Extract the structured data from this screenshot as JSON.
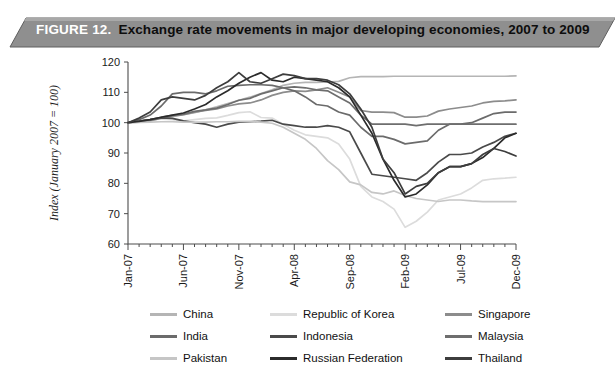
{
  "banner": {
    "figure_label": "FIGURE 12.",
    "title": "Exchange rate movements in major developing economies, 2007 to 2009",
    "banner_color": "#8f8f8f",
    "banner_edge_color": "#5e5e5e",
    "figure_label_color": "#ffffff",
    "title_color": "#0d0d0d"
  },
  "chart_data": {
    "type": "line",
    "title": "Exchange rate movements in major developing economies, 2007 to 2009",
    "xlabel": "",
    "ylabel": "Index (January 2007 = 100)",
    "ylim": [
      60,
      120
    ],
    "ytick_values": [
      60,
      70,
      80,
      90,
      100,
      110,
      120
    ],
    "ytick_labels": [
      "60",
      "70",
      "80",
      "90",
      "100",
      "110",
      "120"
    ],
    "grid": false,
    "legend_position": "bottom",
    "x": [
      "Jan-07",
      "Feb-07",
      "Mar-07",
      "Apr-07",
      "May-07",
      "Jun-07",
      "Jul-07",
      "Aug-07",
      "Sep-07",
      "Oct-07",
      "Nov-07",
      "Dec-07",
      "Jan-08",
      "Feb-08",
      "Mar-08",
      "Apr-08",
      "May-08",
      "Jun-08",
      "Jul-08",
      "Aug-08",
      "Sep-08",
      "Oct-08",
      "Nov-08",
      "Dec-08",
      "Jan-09",
      "Feb-09",
      "Mar-09",
      "Apr-09",
      "May-09",
      "Jun-09",
      "Jul-09",
      "Aug-09",
      "Sep-09",
      "Oct-09",
      "Nov-09",
      "Dec-09"
    ],
    "xtick_labels": [
      "Jan-07",
      "Jun-07",
      "Nov-07",
      "Apr-08",
      "Sep-08",
      "Feb-09",
      "Jul-09",
      "Dec-09"
    ],
    "xtick_indices": [
      0,
      5,
      10,
      15,
      20,
      25,
      30,
      35
    ],
    "series": [
      {
        "name": "China",
        "color": "#b5b5b5",
        "values": [
          100,
          100.4,
          101,
          101.5,
          102,
          102.6,
          103.3,
          104.2,
          105.2,
          106.3,
          107.4,
          108.4,
          109.6,
          110.8,
          112.3,
          113,
          113.3,
          113.3,
          113.4,
          113.6,
          114.8,
          115.2,
          115.2,
          115.2,
          115.3,
          115.3,
          115.3,
          115.3,
          115.3,
          115.3,
          115.3,
          115.3,
          115.3,
          115.3,
          115.3,
          115.4
        ]
      },
      {
        "name": "Republic of Korea",
        "color": "#dcdcdc",
        "values": [
          100,
          100.3,
          100.8,
          101.2,
          101,
          100.6,
          101,
          101.4,
          101.6,
          102.4,
          103.3,
          103.6,
          101.7,
          101.5,
          99.5,
          97.5,
          96,
          95.5,
          95,
          93,
          88,
          79,
          75.5,
          74,
          71.5,
          65.5,
          67.5,
          70.5,
          74.5,
          75.5,
          76.5,
          78.5,
          81,
          81.5,
          81.7,
          82
        ]
      },
      {
        "name": "Singapore",
        "color": "#8c8c8c",
        "values": [
          100,
          100.2,
          100.6,
          101.5,
          102.2,
          102.6,
          103.5,
          104,
          104.5,
          105.5,
          106.2,
          106.5,
          107.5,
          109,
          110,
          110.5,
          110.3,
          110.8,
          111.5,
          110,
          108.5,
          104,
          103.5,
          103.5,
          103.3,
          101.8,
          101.8,
          102.2,
          103.8,
          104.5,
          105,
          105.5,
          106.5,
          107,
          107.2,
          107.5
        ]
      },
      {
        "name": "India",
        "color": "#6b6b6b",
        "values": [
          100,
          101,
          102.5,
          105.5,
          109.5,
          110,
          110,
          109.5,
          110.5,
          112,
          112.3,
          112.5,
          112.5,
          112.3,
          111.5,
          110.5,
          108.5,
          106,
          105.5,
          103.5,
          102.5,
          98.5,
          95.5,
          95.5,
          94.5,
          93,
          93.5,
          94,
          97.5,
          99.5,
          99.5,
          100,
          101.5,
          103,
          103.5,
          103.5
        ]
      },
      {
        "name": "Indonesia",
        "color": "#4a4a4a",
        "values": [
          100,
          100.5,
          101,
          101.6,
          101.4,
          100.6,
          100,
          99.5,
          98.5,
          99.5,
          100.2,
          100.3,
          100.5,
          100.8,
          99.5,
          99,
          98.5,
          98.5,
          99,
          98.5,
          97,
          90,
          83,
          82.5,
          82,
          81.5,
          81,
          83.5,
          87,
          89.5,
          89.5,
          90,
          92,
          93.5,
          95.5,
          96.5
        ]
      },
      {
        "name": "Malaysia",
        "color": "#6e6e6e",
        "values": [
          100,
          100.4,
          101,
          101.8,
          102.4,
          102.8,
          103.7,
          104.2,
          104.8,
          106,
          107.4,
          108,
          109.5,
          110.5,
          111.5,
          111.8,
          111.5,
          110.8,
          110.5,
          108.5,
          106.5,
          102.5,
          99.5,
          99.5,
          99.5,
          99.5,
          99,
          99.5,
          99.5,
          99.5,
          99.5,
          99.5,
          99.5,
          99.5,
          99.5,
          99.5
        ]
      },
      {
        "name": "Pakistan",
        "color": "#c6c6c6",
        "values": [
          100,
          100.1,
          100.2,
          100.3,
          100.3,
          100.2,
          100.2,
          100.2,
          100.3,
          100.3,
          100.4,
          100.4,
          100.2,
          99.8,
          98.5,
          96.5,
          94.5,
          91.5,
          87.5,
          84.5,
          80.5,
          79.5,
          77,
          76.5,
          77.5,
          76,
          75,
          74.5,
          74,
          74.5,
          74.5,
          74.2,
          74,
          74,
          74,
          74
        ]
      },
      {
        "name": "Russian Federation",
        "color": "#2b2b2b",
        "values": [
          100,
          100.4,
          101,
          101.8,
          102.5,
          103.2,
          104.5,
          106,
          108.5,
          110.5,
          113,
          115,
          116.5,
          114,
          113.5,
          115,
          114.5,
          114,
          113.5,
          111.5,
          108.5,
          102.5,
          96.5,
          88,
          81,
          75.5,
          76.5,
          79.5,
          83.5,
          85.5,
          85.5,
          86.5,
          88.5,
          91.5,
          95,
          96.5
        ]
      },
      {
        "name": "Thailand",
        "color": "#3d3d3d",
        "values": [
          100,
          101.5,
          103.5,
          107.5,
          108.5,
          108,
          107.5,
          109,
          111.5,
          113.5,
          116.5,
          113.5,
          113,
          114.5,
          116,
          115.5,
          114.5,
          114.5,
          114,
          112.5,
          109.5,
          104.5,
          98.5,
          88,
          83.5,
          76.5,
          79,
          80,
          83.5,
          85.5,
          85.5,
          86.5,
          89.5,
          91.5,
          90.5,
          89
        ]
      }
    ]
  },
  "legend": {
    "items": [
      {
        "name": "China",
        "color": "#b5b5b5"
      },
      {
        "name": "Republic of Korea",
        "color": "#dcdcdc"
      },
      {
        "name": "Singapore",
        "color": "#8c8c8c"
      },
      {
        "name": "India",
        "color": "#6b6b6b"
      },
      {
        "name": "Indonesia",
        "color": "#4a4a4a"
      },
      {
        "name": "Malaysia",
        "color": "#6e6e6e"
      },
      {
        "name": "Pakistan",
        "color": "#c6c6c6"
      },
      {
        "name": "Russian Federation",
        "color": "#2b2b2b"
      },
      {
        "name": "Thailand",
        "color": "#3d3d3d"
      }
    ]
  }
}
